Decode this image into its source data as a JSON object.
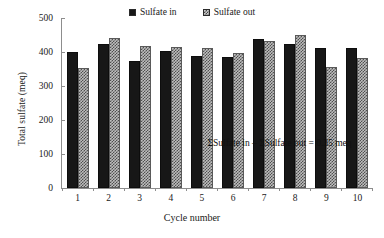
{
  "chart_data": {
    "type": "bar",
    "title": "",
    "xlabel": "Cycle number",
    "ylabel": "Total sulfate (meq)",
    "categories": [
      "1",
      "2",
      "3",
      "4",
      "5",
      "6",
      "7",
      "8",
      "9",
      "10"
    ],
    "series": [
      {
        "name": "Sulfate in",
        "values": [
          400,
          423,
          375,
          403,
          387,
          385,
          437,
          425,
          411,
          413
        ],
        "color": "#171717",
        "fill": "solid"
      },
      {
        "name": "Sulfate out",
        "values": [
          354,
          442,
          419,
          415,
          411,
          398,
          433,
          451,
          357,
          383
        ],
        "color": "#bdbdbd",
        "fill": "checkered"
      }
    ],
    "ylim": [
      0,
      500
    ],
    "yticks": [
      0,
      100,
      200,
      300,
      400,
      500
    ],
    "ytick_labels": [
      "0",
      "100",
      "200",
      "300",
      "400",
      "500"
    ],
    "grid": false,
    "legend_position": "top-center",
    "annotations": [
      {
        "text": "ΣSulfate  in – ΣSulfate  out = 0.35 meq",
        "x": "center",
        "y": 150
      }
    ]
  },
  "legend": {
    "items": [
      {
        "label": "Sulfate in"
      },
      {
        "label": "Sulfate out"
      }
    ]
  },
  "axes": {
    "y_title": "Total sulfate (meq)",
    "x_title": "Cycle number"
  },
  "annotation": {
    "text": "ΣSulfate  in – ΣSulfate  out = 0.35 meq"
  }
}
